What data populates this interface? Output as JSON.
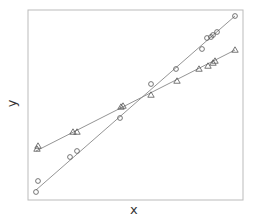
{
  "chart_data": {
    "type": "scatter",
    "title": "",
    "xlabel": "x",
    "ylabel": "y",
    "xlim": [
      0,
      215
    ],
    "ylim": [
      0,
      190
    ],
    "grid": false,
    "legend": null,
    "frame": {
      "left": 28,
      "top": 10,
      "right": 243,
      "bottom": 200
    },
    "series": [
      {
        "name": "circles",
        "marker": "circle",
        "color": "#555555",
        "fit_line": {
          "x0": 8,
          "y0": 10,
          "x1": 207,
          "y1": 184
        },
        "points": [
          [
            8,
            8
          ],
          [
            10,
            19
          ],
          [
            42,
            43
          ],
          [
            49,
            49
          ],
          [
            92,
            82
          ],
          [
            123,
            116
          ],
          [
            148,
            131
          ],
          [
            174,
            151
          ],
          [
            179,
            162
          ],
          [
            183,
            163
          ],
          [
            185,
            165
          ],
          [
            189,
            168
          ],
          [
            207,
            184
          ]
        ]
      },
      {
        "name": "triangles",
        "marker": "triangle",
        "color": "#555555",
        "fit_line": {
          "x0": 8,
          "y0": 49,
          "x1": 207,
          "y1": 150
        },
        "points": [
          [
            9,
            51
          ],
          [
            10,
            54
          ],
          [
            45,
            68
          ],
          [
            49,
            68
          ],
          [
            93,
            93
          ],
          [
            95,
            94
          ],
          [
            123,
            105
          ],
          [
            149,
            119
          ],
          [
            171,
            131
          ],
          [
            180,
            134
          ],
          [
            185,
            137
          ],
          [
            187,
            139
          ],
          [
            207,
            150
          ]
        ]
      }
    ]
  }
}
